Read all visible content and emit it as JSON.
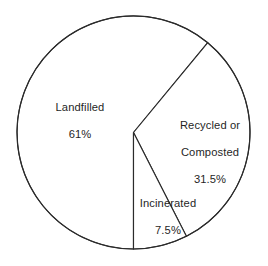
{
  "chart_data": {
    "type": "pie",
    "title": "",
    "subtitle": "",
    "xlabel": "",
    "ylabel": "",
    "legend_position": "none",
    "grid": false,
    "labels_inside": true,
    "units": "percent",
    "total": 100,
    "categories": [
      "Landfilled",
      "Recycled or Composted",
      "Incinerated"
    ],
    "values": [
      61,
      31.5,
      7.5
    ],
    "value_labels": [
      "61%",
      "31.5%",
      "7.5%"
    ],
    "slices": [
      {
        "name": "Landfilled",
        "label": "Landfilled",
        "value": 61,
        "value_label": "61%",
        "angle_degrees": 219.6,
        "color": "#ffffff",
        "stroke": "#2b2b2b",
        "start_angle": 90,
        "end_angle": 309.6
      },
      {
        "name": "Recycled or Composted",
        "label": "Recycled or\nComposted",
        "label_line_1": "Recycled or",
        "label_line_2": "Composted",
        "value": 31.5,
        "value_label": "31.5%",
        "angle_degrees": 113.4,
        "color": "#ffffff",
        "stroke": "#2b2b2b",
        "start_angle": 309.6,
        "end_angle": 63
      },
      {
        "name": "Incinerated",
        "label": "Incinerated",
        "value": 7.5,
        "value_label": "7.5%",
        "angle_degrees": 27,
        "color": "#ffffff",
        "stroke": "#2b2b2b",
        "start_angle": 63,
        "end_angle": 90
      }
    ],
    "geometry": {
      "center_x": 133.5,
      "center_y": 132.5,
      "radius": 116.5
    },
    "colors": {
      "background": "#ffffff",
      "line": "#2b2b2b",
      "text": "#1f1f1f"
    }
  }
}
